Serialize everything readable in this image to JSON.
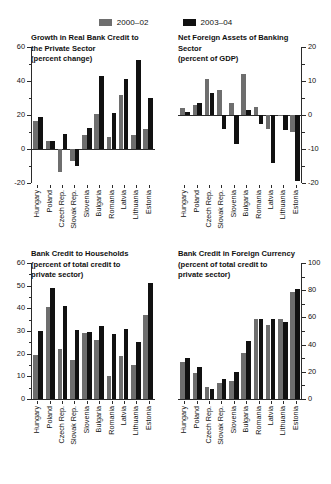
{
  "legend": {
    "entries": [
      {
        "label": "2000–02",
        "color": "#6e6e6e",
        "series_key": "s2000_02"
      },
      {
        "label": "2003–04",
        "color": "#111111",
        "series_key": "s2003_04"
      }
    ]
  },
  "categories": [
    "Hungary",
    "Poland",
    "Czech Rep.",
    "Slovak Rep.",
    "Slovenia",
    "Bulgaria",
    "Romania",
    "Latvia",
    "Lithuania",
    "Estonia"
  ],
  "panels": [
    {
      "id": "growth-real-bank-credit",
      "title": "Growth in Real Bank Credit to\nthe Private Sector\n(percent change)",
      "axis_side": "left",
      "ylim": [
        -20,
        60
      ],
      "ticks": [
        60,
        40,
        20,
        0,
        -20
      ],
      "minor_ticks": [
        50,
        30,
        10,
        -10
      ],
      "tick_labels": [
        "60",
        "40",
        "20",
        "0",
        "-20"
      ]
    },
    {
      "id": "net-foreign-assets",
      "title": "Net Foreign Assets of Banking\nSector\n(percent of GDP)",
      "axis_side": "right",
      "ylim": [
        -20,
        20
      ],
      "ticks": [
        20,
        10,
        0,
        -10,
        -20
      ],
      "minor_ticks": [
        15,
        5,
        -5,
        -15
      ],
      "tick_labels": [
        "20",
        "10",
        "0",
        "-10",
        "-20"
      ]
    },
    {
      "id": "bank-credit-households",
      "title": "Bank Credit to Households\n(percent of total credit to\nprivate sector)",
      "axis_side": "left",
      "ylim": [
        0,
        60
      ],
      "ticks": [
        60,
        50,
        40,
        30,
        20,
        10,
        0
      ],
      "minor_ticks": [
        55,
        45,
        35,
        25,
        15,
        5
      ],
      "tick_labels": [
        "60",
        "50",
        "40",
        "30",
        "20",
        "10",
        "0"
      ]
    },
    {
      "id": "bank-credit-foreign-currency",
      "title": "Bank Credit in Foreign Currency\n(percent of total credit to\nprivate sector)",
      "axis_side": "right",
      "ylim": [
        0,
        100
      ],
      "ticks": [
        100,
        80,
        60,
        40,
        20,
        0
      ],
      "minor_ticks": [
        90,
        70,
        50,
        30,
        10
      ],
      "tick_labels": [
        "100",
        "80",
        "60",
        "40",
        "20",
        "0"
      ]
    }
  ],
  "chart_data": [
    {
      "type": "bar",
      "title": "Growth in Real Bank Credit to the Private Sector",
      "subtitle": "(percent change)",
      "xlabel": "",
      "ylabel": "percent change",
      "ylim": [
        -20,
        60
      ],
      "yticks": [
        -20,
        0,
        20,
        40,
        60
      ],
      "grid": false,
      "legend_position": "top-center",
      "categories": [
        "Hungary",
        "Poland",
        "Czech Rep.",
        "Slovak Rep.",
        "Slovenia",
        "Bulgaria",
        "Romania",
        "Latvia",
        "Lithuania",
        "Estonia"
      ],
      "series": [
        {
          "name": "2000–02",
          "color": "#6e6e6e",
          "values": [
            16.5,
            4.5,
            -13.5,
            -7.0,
            8.0,
            20.5,
            7.0,
            32.0,
            8.0,
            12.0
          ]
        },
        {
          "name": "2003–04",
          "color": "#111111",
          "values": [
            19.0,
            4.5,
            9.0,
            -10.0,
            12.5,
            43.0,
            21.0,
            41.0,
            52.5,
            30.0
          ]
        }
      ]
    },
    {
      "type": "bar",
      "title": "Net Foreign Assets of Banking Sector",
      "subtitle": "(percent of GDP)",
      "xlabel": "",
      "ylabel": "percent of GDP",
      "ylim": [
        -20,
        20
      ],
      "yticks": [
        -20,
        -10,
        0,
        10,
        20
      ],
      "grid": false,
      "legend_position": "top-center",
      "categories": [
        "Hungary",
        "Poland",
        "Czech Rep.",
        "Slovak Rep.",
        "Slovenia",
        "Bulgaria",
        "Romania",
        "Latvia",
        "Lithuania",
        "Estonia"
      ],
      "series": [
        {
          "name": "2000–02",
          "color": "#6e6e6e",
          "values": [
            2.0,
            3.0,
            10.5,
            7.5,
            3.5,
            12.0,
            2.5,
            -4.0,
            -0.3,
            -5.0
          ]
        },
        {
          "name": "2003–04",
          "color": "#111111",
          "values": [
            1.0,
            3.5,
            6.5,
            -4.0,
            -8.5,
            1.5,
            -2.5,
            -14.0,
            -4.5,
            -19.5
          ]
        }
      ]
    },
    {
      "type": "bar",
      "title": "Bank Credit to Households",
      "subtitle": "(percent of total credit to private sector)",
      "xlabel": "",
      "ylabel": "percent of total credit to private sector",
      "ylim": [
        0,
        60
      ],
      "yticks": [
        0,
        10,
        20,
        30,
        40,
        50,
        60
      ],
      "grid": false,
      "legend_position": "top-center",
      "categories": [
        "Hungary",
        "Poland",
        "Czech Rep.",
        "Slovak Rep.",
        "Slovenia",
        "Bulgaria",
        "Romania",
        "Latvia",
        "Lithuania",
        "Estonia"
      ],
      "series": [
        {
          "name": "2000–02",
          "color": "#6e6e6e",
          "values": [
            19.5,
            40.5,
            22.0,
            17.0,
            29.0,
            26.0,
            10.0,
            19.0,
            15.0,
            37.0
          ]
        },
        {
          "name": "2003–04",
          "color": "#111111",
          "values": [
            30.0,
            49.0,
            41.0,
            30.5,
            29.5,
            32.0,
            28.5,
            31.0,
            25.0,
            51.0
          ]
        }
      ]
    },
    {
      "type": "bar",
      "title": "Bank Credit in Foreign Currency",
      "subtitle": "(percent of total credit to private sector)",
      "xlabel": "",
      "ylabel": "percent of total credit to private sector",
      "ylim": [
        0,
        100
      ],
      "yticks": [
        0,
        20,
        40,
        60,
        80,
        100
      ],
      "grid": false,
      "legend_position": "top-center",
      "categories": [
        "Hungary",
        "Poland",
        "Czech Rep.",
        "Slovak Rep.",
        "Slovenia",
        "Bulgaria",
        "Romania",
        "Latvia",
        "Lithuania",
        "Estonia"
      ],
      "series": [
        {
          "name": "2000–02",
          "color": "#6e6e6e",
          "values": [
            27.0,
            19.0,
            8.5,
            11.5,
            13.0,
            34.0,
            58.5,
            54.5,
            58.5,
            79.0
          ]
        },
        {
          "name": "2003–04",
          "color": "#111111",
          "values": [
            30.0,
            23.5,
            7.0,
            15.0,
            20.0,
            43.0,
            58.5,
            58.5,
            56.5,
            81.0
          ]
        }
      ]
    }
  ]
}
